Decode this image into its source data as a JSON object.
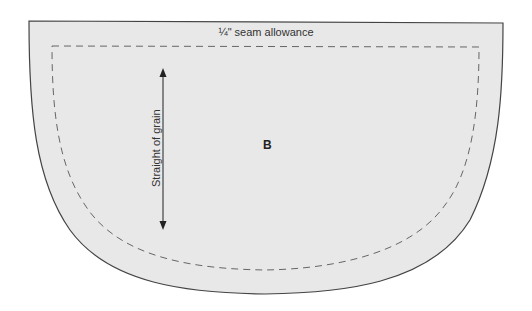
{
  "pattern": {
    "piece_label": "B",
    "seam_allowance_label": "¼\" seam allowance",
    "grain_label": "Straight of grain",
    "colors": {
      "fill": "#e8e8e8",
      "outline": "#444444",
      "dashed": "#666666",
      "arrow": "#222222"
    }
  }
}
